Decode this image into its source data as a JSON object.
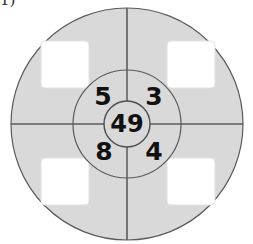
{
  "label": {
    "text": "1)"
  },
  "figure": {
    "name": "concentric-wheel-diagram",
    "colors": {
      "background": "#ffffff",
      "disc_fill": "#d9d9d9",
      "inner_fill": "#d9d9d9",
      "core_fill": "#d9d9d9",
      "square_fill": "#ffffff",
      "stroke": "#5a5a5a",
      "text": "#111111"
    },
    "outer_circle": {
      "name": "outer-disc",
      "cx": 127,
      "cy": 124,
      "r": 116
    },
    "middle_circle": {
      "name": "middle-disc",
      "cx": 127,
      "cy": 124,
      "r": 54
    },
    "inner_circle": {
      "name": "center-circle",
      "cx": 127,
      "cy": 124,
      "r": 23
    },
    "crosshair": {
      "name": "crosshair-lines",
      "vertical_x": 127,
      "horizontal_y": 124
    },
    "squares": [
      {
        "name": "square-top-left",
        "x": 41,
        "y": 41,
        "w": 48,
        "h": 47,
        "value": ""
      },
      {
        "name": "square-top-right",
        "x": 167,
        "y": 41,
        "w": 48,
        "h": 47,
        "value": ""
      },
      {
        "name": "square-bottom-left",
        "x": 41,
        "y": 158,
        "w": 48,
        "h": 47,
        "value": ""
      },
      {
        "name": "square-bottom-right",
        "x": 167,
        "y": 158,
        "w": 48,
        "h": 47,
        "value": ""
      }
    ],
    "numbers": [
      {
        "name": "number-top-left",
        "value": "5",
        "x": 103,
        "y": 105,
        "size": 25
      },
      {
        "name": "number-top-right",
        "value": "3",
        "x": 154,
        "y": 105,
        "size": 25
      },
      {
        "name": "number-center",
        "value": "49",
        "x": 127,
        "y": 132,
        "size": 24
      },
      {
        "name": "number-bottom-left",
        "value": "8",
        "x": 104,
        "y": 160,
        "size": 25
      },
      {
        "name": "number-bottom-right",
        "value": "4",
        "x": 154,
        "y": 160,
        "size": 25
      }
    ]
  }
}
